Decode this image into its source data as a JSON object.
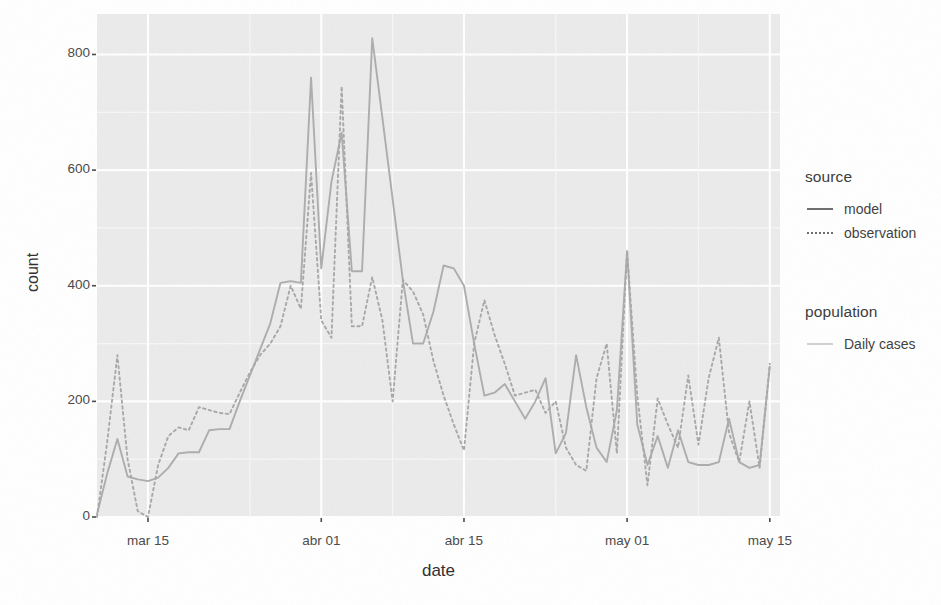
{
  "chart_data": {
    "type": "line",
    "title": "",
    "xlabel": "date",
    "ylabel": "count",
    "grid": true,
    "legend_position": "right",
    "ylim": [
      0,
      870
    ],
    "yticks": [
      0,
      200,
      400,
      600,
      800
    ],
    "ytick_labels": [
      "0",
      "200",
      "400",
      "600",
      "800"
    ],
    "xticks": [
      "mar 15",
      "abr 01",
      "abr 15",
      "may 01",
      "may 15"
    ],
    "xtick_days": [
      14,
      31,
      45,
      61,
      75
    ],
    "x_start_day": 9,
    "x_end_day": 76,
    "x": [
      9,
      10,
      11,
      12,
      13,
      14,
      15,
      16,
      17,
      18,
      19,
      20,
      21,
      22,
      23,
      24,
      25,
      26,
      27,
      28,
      29,
      30,
      31,
      32,
      33,
      34,
      35,
      36,
      37,
      38,
      39,
      40,
      41,
      42,
      43,
      44,
      45,
      46,
      47,
      48,
      49,
      50,
      51,
      52,
      53,
      54,
      55,
      56,
      57,
      58,
      59,
      60,
      61,
      62,
      63,
      64,
      65,
      66,
      67,
      68,
      69,
      70,
      71,
      72,
      73,
      74,
      75
    ],
    "series": [
      {
        "name": "model",
        "style": "solid",
        "color": "#adadad",
        "values": [
          5,
          75,
          135,
          70,
          65,
          62,
          68,
          85,
          110,
          112,
          112,
          150,
          152,
          152,
          200,
          245,
          290,
          335,
          405,
          408,
          405,
          760,
          430,
          580,
          665,
          425,
          425,
          828,
          690,
          550,
          410,
          300,
          300,
          355,
          435,
          430,
          400,
          300,
          210,
          215,
          230,
          200,
          170,
          200,
          240,
          110,
          145,
          280,
          190,
          120,
          95,
          185,
          460,
          160,
          90,
          140,
          85,
          150,
          95,
          90,
          90,
          95,
          170,
          95,
          85,
          90,
          260
        ]
      },
      {
        "name": "observation",
        "style": "dotted",
        "color": "#a8a8a8",
        "values": [
          0,
          130,
          280,
          100,
          10,
          0,
          90,
          140,
          155,
          150,
          190,
          185,
          180,
          178,
          215,
          250,
          280,
          300,
          330,
          400,
          360,
          595,
          340,
          310,
          745,
          330,
          330,
          415,
          340,
          200,
          410,
          390,
          350,
          270,
          210,
          160,
          115,
          300,
          375,
          315,
          265,
          210,
          215,
          220,
          180,
          200,
          120,
          90,
          80,
          240,
          300,
          110,
          460,
          210,
          55,
          205,
          160,
          120,
          245,
          125,
          240,
          310,
          145,
          95,
          200,
          85,
          265
        ]
      }
    ],
    "population_series": [
      {
        "name": "Daily cases",
        "style": "solid",
        "color": "#d9d9d9"
      }
    ]
  },
  "legend": {
    "source": {
      "title": "source",
      "items": [
        {
          "label": "model",
          "style": "solid"
        },
        {
          "label": "observation",
          "style": "dotted"
        }
      ]
    },
    "population": {
      "title": "population",
      "items": [
        {
          "label": "Daily cases",
          "style": "solid"
        }
      ]
    }
  },
  "colors": {
    "panel_background": "#ebebeb",
    "gridline_major": "#ffffff",
    "gridline_minor": "#f7f7f7",
    "line_model": "#adadad",
    "line_observation": "#a8a8a8",
    "line_daily_cases": "#d9d9d9",
    "text": "#3a3a3a"
  }
}
